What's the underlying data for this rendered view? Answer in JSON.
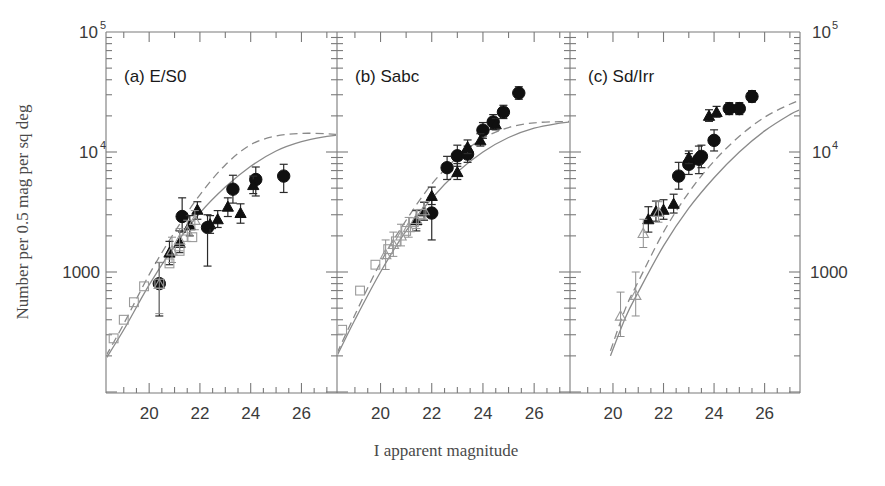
{
  "figure": {
    "xlabel": "I apparent magnitude",
    "ylabel": "Number per 0.5 mag per sq deg",
    "y_tick_labels": [
      "10",
      "5",
      "10",
      "4",
      "1000"
    ],
    "y_left_labels": [
      {
        "mantissa": "10",
        "exp": "5",
        "plain": ""
      },
      {
        "mantissa": "10",
        "exp": "4",
        "plain": ""
      },
      {
        "mantissa": "",
        "exp": "",
        "plain": "1000"
      }
    ],
    "y_right_labels": [
      {
        "mantissa": "10",
        "exp": "5",
        "plain": ""
      },
      {
        "mantissa": "10",
        "exp": "4",
        "plain": ""
      },
      {
        "mantissa": "",
        "exp": "",
        "plain": "1000"
      }
    ],
    "x_tick_labels": [
      "20",
      "22",
      "24",
      "26"
    ],
    "panel_a_label": "(a) E/S0",
    "panel_b_label": "(b) Sabc",
    "panel_c_label": "(c) Sd/Irr"
  },
  "chart_data": {
    "type": "scatter",
    "title": "",
    "xlabel": "I apparent magnitude",
    "ylabel": "Number per 0.5 mag per sq deg",
    "xlim": [
      18.3,
      27.4
    ],
    "ylim": [
      200,
      100000
    ],
    "yscale": "log",
    "xticks": [
      20,
      22,
      24,
      26
    ],
    "yticks": [
      1000,
      10000,
      100000
    ],
    "ytick_labels": [
      "1000",
      "10^4",
      "10^5"
    ],
    "grid": false,
    "legend": null,
    "panels": [
      {
        "id": "a",
        "label": "(a) E/S0",
        "series": [
          {
            "name": "filled-circle",
            "marker": "filled-circle",
            "points": [
              {
                "x": 20.4,
                "y": 800,
                "ylo": 430,
                "yhi": 1200
              },
              {
                "x": 21.3,
                "y": 2900,
                "ylo": 2150,
                "yhi": 4150
              },
              {
                "x": 22.3,
                "y": 2350,
                "ylo": 1120,
                "yhi": 3000
              },
              {
                "x": 23.3,
                "y": 4900,
                "ylo": 3750,
                "yhi": 6400
              },
              {
                "x": 24.2,
                "y": 5900,
                "ylo": 4300,
                "yhi": 7500
              },
              {
                "x": 25.3,
                "y": 6300,
                "ylo": 4600,
                "yhi": 7900
              }
            ]
          },
          {
            "name": "filled-triangle",
            "marker": "filled-triangle",
            "points": [
              {
                "x": 20.8,
                "y": 1450,
                "ylo": 1150,
                "yhi": 1800
              },
              {
                "x": 21.2,
                "y": 1750,
                "ylo": 1450,
                "yhi": 2200
              },
              {
                "x": 21.6,
                "y": 2450,
                "ylo": 2000,
                "yhi": 2950
              },
              {
                "x": 21.9,
                "y": 3300,
                "ylo": 2750,
                "yhi": 3850
              },
              {
                "x": 22.4,
                "y": 2500,
                "ylo": 2100,
                "yhi": 2950
              },
              {
                "x": 22.7,
                "y": 2750,
                "ylo": 2350,
                "yhi": 3250
              },
              {
                "x": 23.1,
                "y": 3500,
                "ylo": 2900,
                "yhi": 4150
              },
              {
                "x": 23.6,
                "y": 3100,
                "ylo": 2550,
                "yhi": 3700
              },
              {
                "x": 24.1,
                "y": 5300,
                "ylo": 4500,
                "yhi": 6300
              }
            ]
          },
          {
            "name": "open-triangle",
            "marker": "open-triangle",
            "points": [
              {
                "x": 20.4,
                "y": 790,
                "ylo": 450,
                "yhi": 1200
              },
              {
                "x": 20.9,
                "y": 1500,
                "ylo": 1200,
                "yhi": 1950
              },
              {
                "x": 21.2,
                "y": 1850,
                "ylo": 1500,
                "yhi": 2300
              },
              {
                "x": 21.5,
                "y": 2200,
                "ylo": 1800,
                "yhi": 2700
              },
              {
                "x": 21.8,
                "y": 2700,
                "ylo": 2250,
                "yhi": 3250
              }
            ]
          },
          {
            "name": "open-square",
            "marker": "open-square",
            "points": [
              {
                "x": 18.6,
                "y": 280
              },
              {
                "x": 19.0,
                "y": 400
              },
              {
                "x": 19.4,
                "y": 560
              },
              {
                "x": 19.8,
                "y": 760
              },
              {
                "x": 20.4,
                "y": 800
              },
              {
                "x": 20.8,
                "y": 1180
              },
              {
                "x": 21.2,
                "y": 1500
              },
              {
                "x": 21.7,
                "y": 1950
              }
            ]
          }
        ],
        "curves": [
          {
            "name": "model-solid",
            "style": "solid",
            "x": [
              18.3,
              19.0,
              20.0,
              21.0,
              22.0,
              23.0,
              24.0,
              25.0,
              26.0,
              27.0,
              27.4
            ],
            "y": [
              190,
              330,
              780,
              1650,
              3100,
              5100,
              7600,
              10200,
              12200,
              13500,
              13800
            ]
          },
          {
            "name": "model-dashed",
            "style": "dashed",
            "x": [
              18.3,
              19.0,
              20.0,
              21.0,
              22.0,
              23.0,
              24.0,
              25.0,
              26.0,
              27.0,
              27.4
            ],
            "y": [
              200,
              370,
              950,
              2150,
              4400,
              7800,
              11500,
              13600,
              14300,
              14200,
              14000
            ]
          }
        ]
      },
      {
        "id": "b",
        "label": "(b) Sabc",
        "series": [
          {
            "name": "filled-circle",
            "marker": "filled-circle",
            "points": [
              {
                "x": 22.0,
                "y": 3100,
                "ylo": 1850,
                "yhi": 4200
              },
              {
                "x": 22.6,
                "y": 7400,
                "ylo": 5900,
                "yhi": 9200
              },
              {
                "x": 23.0,
                "y": 9300,
                "ylo": 7600,
                "yhi": 11400
              },
              {
                "x": 23.4,
                "y": 9600,
                "ylo": 8200,
                "yhi": 11200
              },
              {
                "x": 24.0,
                "y": 15200,
                "ylo": 13000,
                "yhi": 17600
              },
              {
                "x": 24.4,
                "y": 17800,
                "ylo": 15400,
                "yhi": 20500
              },
              {
                "x": 24.8,
                "y": 21500,
                "ylo": 19000,
                "yhi": 24500
              },
              {
                "x": 25.4,
                "y": 31000,
                "ylo": 27500,
                "yhi": 35000
              }
            ]
          },
          {
            "name": "filled-triangle",
            "marker": "filled-triangle",
            "points": [
              {
                "x": 21.4,
                "y": 2700,
                "ylo": 2200,
                "yhi": 3250
              },
              {
                "x": 21.7,
                "y": 3200,
                "ylo": 2700,
                "yhi": 3800
              },
              {
                "x": 22.0,
                "y": 4300,
                "ylo": 3650,
                "yhi": 5100
              },
              {
                "x": 23.0,
                "y": 6800,
                "ylo": 5900,
                "yhi": 8000
              },
              {
                "x": 23.4,
                "y": 11000,
                "ylo": 9700,
                "yhi": 12600
              },
              {
                "x": 23.9,
                "y": 12500,
                "ylo": 11200,
                "yhi": 14200
              },
              {
                "x": 24.5,
                "y": 17000,
                "ylo": 15300,
                "yhi": 19000
              }
            ]
          },
          {
            "name": "open-triangle",
            "marker": "open-triangle",
            "points": [
              {
                "x": 20.2,
                "y": 1400,
                "ylo": 1050,
                "yhi": 1850
              },
              {
                "x": 20.5,
                "y": 1700,
                "ylo": 1350,
                "yhi": 2150
              },
              {
                "x": 20.8,
                "y": 2000,
                "ylo": 1650,
                "yhi": 2500
              },
              {
                "x": 21.1,
                "y": 2350,
                "ylo": 1950,
                "yhi": 2850
              },
              {
                "x": 21.4,
                "y": 2750,
                "ylo": 2300,
                "yhi": 3300
              },
              {
                "x": 21.7,
                "y": 3250,
                "ylo": 2750,
                "yhi": 3850
              }
            ]
          },
          {
            "name": "open-square",
            "marker": "open-square",
            "points": [
              {
                "x": 18.5,
                "y": 330
              },
              {
                "x": 19.2,
                "y": 700
              },
              {
                "x": 19.8,
                "y": 1150
              },
              {
                "x": 20.3,
                "y": 1550
              },
              {
                "x": 20.6,
                "y": 1800
              },
              {
                "x": 21.0,
                "y": 2200
              },
              {
                "x": 21.3,
                "y": 2600
              },
              {
                "x": 21.6,
                "y": 3050
              }
            ]
          }
        ],
        "curves": [
          {
            "name": "model-solid",
            "style": "solid",
            "x": [
              18.3,
              19.0,
              20.0,
              21.0,
              22.0,
              23.0,
              24.0,
              25.0,
              26.0,
              27.0,
              27.4
            ],
            "y": [
              200,
              400,
              1000,
              2200,
              4100,
              6800,
              10000,
              13200,
              15800,
              17400,
              17800
            ]
          },
          {
            "name": "model-dashed",
            "style": "dashed",
            "x": [
              18.3,
              19.0,
              20.0,
              21.0,
              22.0,
              23.0,
              24.0,
              25.0,
              26.0,
              27.0,
              27.4
            ],
            "y": [
              210,
              440,
              1200,
              2700,
              5400,
              9000,
              13000,
              16000,
              17500,
              17900,
              18000
            ]
          }
        ]
      },
      {
        "id": "c",
        "label": "(c) Sd/Irr",
        "series": [
          {
            "name": "filled-circle",
            "marker": "filled-circle",
            "points": [
              {
                "x": 22.6,
                "y": 6300,
                "ylo": 4900,
                "yhi": 8200
              },
              {
                "x": 23.0,
                "y": 7900,
                "ylo": 6500,
                "yhi": 9700
              },
              {
                "x": 23.4,
                "y": 8700,
                "ylo": 6600,
                "yhi": 11200
              },
              {
                "x": 23.5,
                "y": 9200,
                "ylo": 7400,
                "yhi": 11400
              },
              {
                "x": 24.0,
                "y": 12500,
                "ylo": 10200,
                "yhi": 15300
              },
              {
                "x": 24.6,
                "y": 23000,
                "ylo": 20500,
                "yhi": 25800
              },
              {
                "x": 25.0,
                "y": 23000,
                "ylo": 20500,
                "yhi": 25800
              },
              {
                "x": 25.5,
                "y": 29000,
                "ylo": 26000,
                "yhi": 32500
              }
            ]
          },
          {
            "name": "filled-triangle",
            "marker": "filled-triangle",
            "points": [
              {
                "x": 21.4,
                "y": 2750,
                "ylo": 2150,
                "yhi": 3500
              },
              {
                "x": 21.7,
                "y": 3200,
                "ylo": 2650,
                "yhi": 3900
              },
              {
                "x": 22.0,
                "y": 3300,
                "ylo": 2750,
                "yhi": 4000
              },
              {
                "x": 22.4,
                "y": 3700,
                "ylo": 3100,
                "yhi": 4450
              },
              {
                "x": 23.0,
                "y": 9000,
                "ylo": 8000,
                "yhi": 10200
              },
              {
                "x": 23.8,
                "y": 20000,
                "ylo": 18000,
                "yhi": 22500
              },
              {
                "x": 24.1,
                "y": 21500,
                "ylo": 19500,
                "yhi": 24000
              }
            ]
          },
          {
            "name": "open-triangle",
            "marker": "open-triangle",
            "points": [
              {
                "x": 20.3,
                "y": 430,
                "ylo": 290,
                "yhi": 680
              },
              {
                "x": 20.9,
                "y": 640,
                "ylo": 430,
                "yhi": 1000
              },
              {
                "x": 21.2,
                "y": 2100,
                "ylo": 1600,
                "yhi": 2750
              },
              {
                "x": 21.8,
                "y": 3150,
                "ylo": 2600,
                "yhi": 3850
              }
            ]
          },
          {
            "name": "open-square",
            "marker": "open-square",
            "points": []
          }
        ],
        "curves": [
          {
            "name": "model-solid",
            "style": "solid",
            "x": [
              19.9,
              20.5,
              21.0,
              22.0,
              23.0,
              24.0,
              25.0,
              26.0,
              27.0,
              27.4
            ],
            "y": [
              200,
              420,
              680,
              1650,
              3400,
              6100,
              10000,
              15000,
              20500,
              22500
            ]
          },
          {
            "name": "model-dashed",
            "style": "dashed",
            "x": [
              19.9,
              20.5,
              21.0,
              22.0,
              23.0,
              24.0,
              25.0,
              26.0,
              27.0,
              27.4
            ],
            "y": [
              220,
              500,
              830,
              2150,
              4600,
              8400,
              13500,
              19500,
              25000,
              27000
            ]
          }
        ]
      }
    ]
  }
}
